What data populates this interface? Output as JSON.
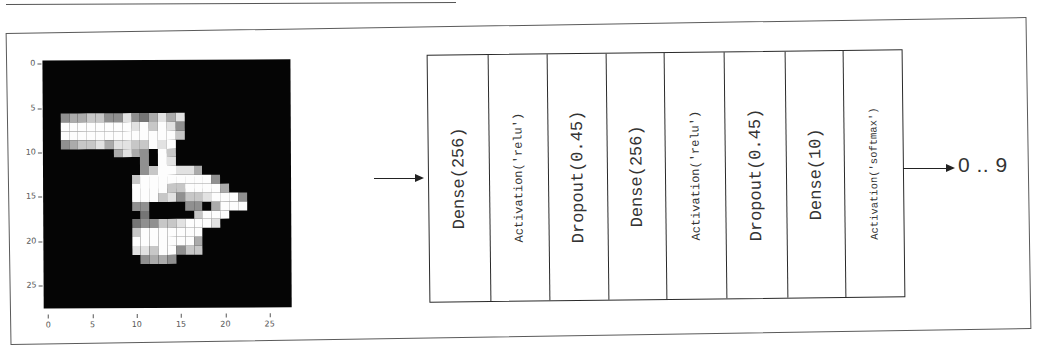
{
  "figure": {
    "input_image": {
      "description": "MNIST handwritten digit (3), 28x28 grayscale",
      "y_ticks": [
        "0",
        "5",
        "10",
        "15",
        "20",
        "25"
      ],
      "x_ticks": [
        "0",
        "5",
        "10",
        "15",
        "20",
        "25"
      ],
      "rows": [
        "............................",
        "............................",
        "............................",
        "............................",
        "............................",
        "............................",
        "..56677558546868............",
        "..99999999897985............",
        "..99999999999997............",
        "..5677868877989.............",
        "........6865.97.............",
        "...........5.98.............",
        "...........5799886..........",
        "..........7999999995........",
        "..........99997799996.......",
        "..........9997857789995.....",
        "..........55....55.6999.....",
        "...........4.....7999.......",
        "..........4557789998........",
        "..........79999999..........",
        "..........99999996..........",
        "..........88799577..........",
        "...........5665.............",
        "............................",
        "............................",
        "............................",
        "............................",
        "............................"
      ]
    },
    "input_arrow": "arrow-right",
    "layers": [
      {
        "label": "Dense(256)",
        "size": "large"
      },
      {
        "label": "Activation('relu')",
        "size": "small"
      },
      {
        "label": "Dropout(0.45)",
        "size": "large"
      },
      {
        "label": "Dense(256)",
        "size": "large"
      },
      {
        "label": "Activation('relu')",
        "size": "small"
      },
      {
        "label": "Dropout(0.45)",
        "size": "large"
      },
      {
        "label": "Dense(10)",
        "size": "large"
      },
      {
        "label": "Activation('softmax')",
        "size": "xsmall"
      }
    ],
    "output_arrow": "arrow-right",
    "output_label": "0 .. 9"
  }
}
